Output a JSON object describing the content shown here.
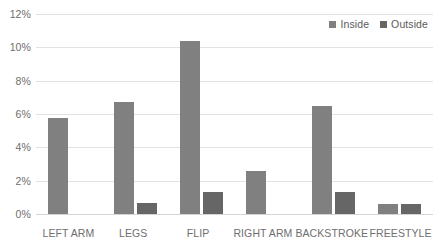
{
  "chart_data": {
    "type": "bar",
    "title": "",
    "xlabel": "",
    "ylabel": "",
    "categories": [
      "LEFT ARM",
      "LEGS",
      "FLIP",
      "RIGHT ARM",
      "BACKSTROKE",
      "FREESTYLE"
    ],
    "series": [
      {
        "name": "Inside",
        "color": "#808080",
        "values": [
          5.75,
          6.7,
          10.4,
          2.6,
          6.5,
          0.6
        ]
      },
      {
        "name": "Outside",
        "color": "#666666",
        "values": [
          0,
          0.65,
          1.3,
          0,
          1.3,
          0.6
        ]
      }
    ],
    "ylim": [
      0,
      12
    ],
    "ytick_values": [
      0,
      2,
      4,
      6,
      8,
      10,
      12
    ],
    "ytick_labels": [
      "0%",
      "2%",
      "4%",
      "6%",
      "8%",
      "10%",
      "12%"
    ],
    "grid": true,
    "grid_axis": "y",
    "legend_position": "top-right",
    "gridline_color": "#e2e2e2",
    "axis_text_color": "#6e6e6e"
  }
}
